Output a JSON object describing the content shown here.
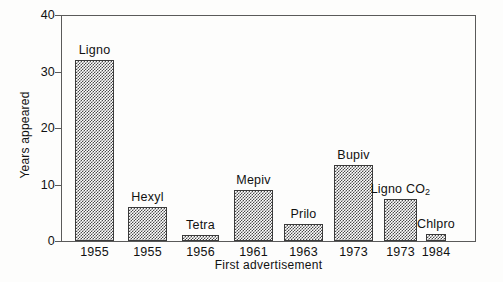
{
  "chart_data": {
    "type": "bar",
    "title": "",
    "subtitle": "",
    "xlabel": "First advertisement",
    "ylabel": "Years appeared",
    "categories": [
      "1955",
      "1955",
      "1956",
      "1961",
      "1963",
      "1973",
      "1973",
      "1984"
    ],
    "bar_labels": [
      "Ligno",
      "Hexyl",
      "Tetra",
      "Mepiv",
      "Prilo",
      "Bupiv",
      "Ligno CO2",
      "Chlpro"
    ],
    "values": [
      32,
      6,
      1,
      9,
      3,
      13.5,
      7,
      1.5
    ],
    "ylim": [
      0,
      40
    ],
    "yticks": [
      0,
      10,
      20,
      30,
      40
    ],
    "ytick_labels": [
      "0",
      "10",
      "20",
      "30",
      "40"
    ],
    "grid": false,
    "legend": "none",
    "bar_fill": "checkerboard-hatch",
    "colors": {
      "background": "#ffffff",
      "axis": "#5a5a5a",
      "text": "#111111",
      "bar_edge": "#3b3b3b",
      "bar_pattern": "#4a4a4a"
    }
  },
  "series_detail": [
    {
      "bar_label": "Ligno",
      "label_html": "Ligno",
      "category": "1955",
      "value": 32,
      "x": 75,
      "width": 39
    },
    {
      "bar_label": "Hexyl",
      "label_html": "Hexyl",
      "category": "1955",
      "value": 6,
      "x": 128,
      "width": 39
    },
    {
      "bar_label": "Tetra",
      "label_html": "Tetra",
      "category": "1956",
      "value": 1,
      "x": 182,
      "width": 37
    },
    {
      "bar_label": "Mepiv",
      "label_html": "Mepiv",
      "category": "1961",
      "value": 9,
      "x": 234,
      "width": 39
    },
    {
      "bar_label": "Prilo",
      "label_html": "Prilo",
      "category": "1963",
      "value": 3,
      "x": 284,
      "width": 39
    },
    {
      "bar_label": "Bupiv",
      "label_html": "Bupiv",
      "category": "1973",
      "value": 13.5,
      "x": 334,
      "width": 39
    },
    {
      "bar_label": "Ligno CO2",
      "label_html": "Ligno CO<sub>2</sub>",
      "category": "1973",
      "value": 7.5,
      "x": 384,
      "width": 33
    },
    {
      "bar_label": "Chlpro",
      "label_html": "Chlpro",
      "category": "1984",
      "value": 1.2,
      "x": 426,
      "width": 20
    }
  ],
  "axis_geometry": {
    "plot_left": 61,
    "plot_right": 476,
    "plot_top": 15,
    "baseline_y": 241,
    "px_per_unit": 5.65
  }
}
